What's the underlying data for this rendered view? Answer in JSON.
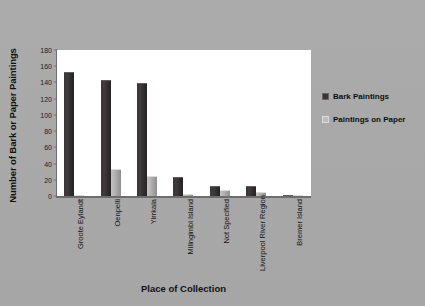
{
  "chart_data": {
    "type": "bar",
    "title": "",
    "xlabel": "Place of Collection",
    "ylabel": "Number of Bark or Paper Paintings",
    "ylim": [
      0,
      180
    ],
    "yticks": [
      0,
      20,
      40,
      60,
      80,
      100,
      120,
      140,
      160,
      180
    ],
    "grid": false,
    "legend_position": "right",
    "categories": [
      "Groote Eylandt",
      "Oenpelli",
      "Yirrkala",
      "Milingimbi Island",
      "Not Specified",
      "Liverpool River Region",
      "Bremer Island"
    ],
    "series": [
      {
        "name": "Bark Paintings",
        "color": "#3a3436",
        "values": [
          153,
          143,
          139,
          23,
          12,
          12,
          1
        ]
      },
      {
        "name": "Paintings on Paper",
        "color": "#bdbdbd",
        "values": [
          1,
          33,
          25,
          2,
          7,
          5,
          0
        ]
      }
    ]
  },
  "legend": {
    "items": [
      {
        "label": "Bark Paintings"
      },
      {
        "label": "Paintings on Paper"
      }
    ]
  }
}
